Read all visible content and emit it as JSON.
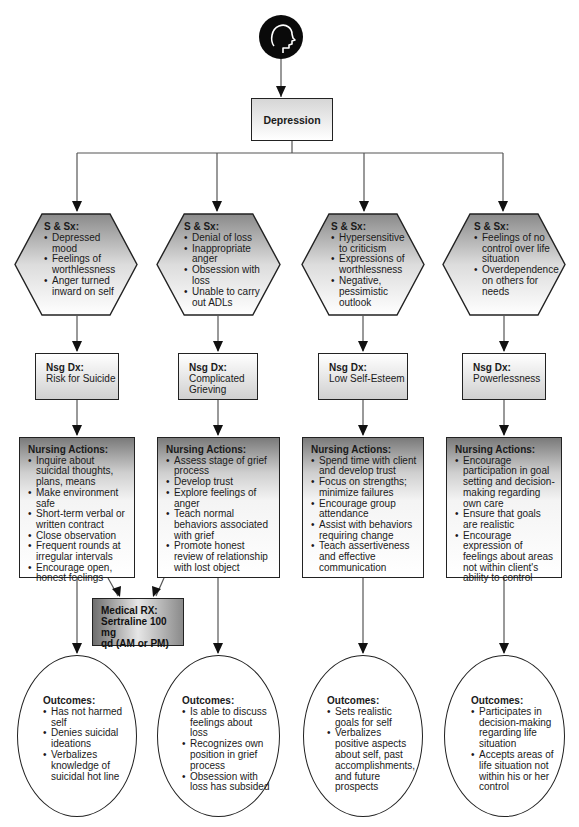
{
  "root": {
    "icon": "head-profile-icon",
    "label": "Depression"
  },
  "columns": [
    {
      "symptoms": {
        "title": "S & Sx:",
        "items": [
          "Depressed mood",
          "Feelings of worthlessness",
          "Anger turned inward on self"
        ]
      },
      "diagnosis": {
        "title": "Nsg Dx:",
        "value": "Risk for Suicide"
      },
      "actions": {
        "title": "Nursing Actions:",
        "items": [
          "Inquire about suicidal thoughts, plans, means",
          "Make environment safe",
          "Short-term verbal or written contract",
          "Close observation",
          "Frequent rounds at irregular intervals",
          "Encourage open, honest feelings"
        ]
      },
      "outcomes": {
        "title": "Outcomes:",
        "items": [
          "Has not harmed self",
          "Denies suicidal ideations",
          "Verbalizes knowledge of suicidal hot line"
        ]
      }
    },
    {
      "symptoms": {
        "title": "S & Sx:",
        "items": [
          "Denial of loss",
          "Inappropriate anger",
          "Obsession with loss",
          "Unable to carry out ADLs"
        ]
      },
      "diagnosis": {
        "title": "Nsg Dx:",
        "value": "Complicated Grieving"
      },
      "actions": {
        "title": "Nursing Actions:",
        "items": [
          "Assess stage of grief process",
          "Develop trust",
          "Explore feelings of anger",
          "Teach normal behaviors associated with grief",
          "Promote honest review of relationship with lost object"
        ]
      },
      "outcomes": {
        "title": "Outcomes:",
        "items": [
          "Is able to discuss feelings about loss",
          "Recognizes own position in grief process",
          "Obsession with loss has subsided"
        ]
      }
    },
    {
      "symptoms": {
        "title": "S & Sx:",
        "items": [
          "Hypersensitive to criticism",
          "Expressions of worthlessness",
          "Negative, pessimistic outlook"
        ]
      },
      "diagnosis": {
        "title": "Nsg Dx:",
        "value": "Low Self-Esteem"
      },
      "actions": {
        "title": "Nursing Actions:",
        "items": [
          "Spend time with client and develop trust",
          "Focus on strengths; minimize failures",
          "Encourage group attendance",
          "Assist with behaviors requiring change",
          "Teach assertiveness and effective communication"
        ]
      },
      "outcomes": {
        "title": "Outcomes:",
        "items": [
          "Sets realistic goals for self",
          "Verbalizes positive aspects about self, past accomplishments, and future prospects"
        ]
      }
    },
    {
      "symptoms": {
        "title": "S & Sx:",
        "items": [
          "Feelings of no control over life situation",
          "Overdependence on others for needs"
        ]
      },
      "diagnosis": {
        "title": "Nsg Dx:",
        "value": "Powerlessness"
      },
      "actions": {
        "title": "Nursing Actions:",
        "items": [
          "Encourage participation in goal setting and decision-making regarding own care",
          "Ensure that goals are realistic",
          "Encourage expression of feelings about areas not within client's ability to control"
        ]
      },
      "outcomes": {
        "title": "Outcomes:",
        "items": [
          "Participates in decision-making regarding life situation",
          "Accepts areas of life situation not within his or her control"
        ]
      }
    }
  ],
  "medical_rx": {
    "title": "Medical RX:",
    "line1": "Sertraline 100 mg",
    "line2": "qd (AM or PM)"
  }
}
